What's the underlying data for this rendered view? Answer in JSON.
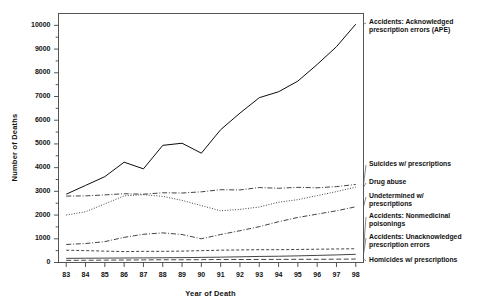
{
  "chart_data": {
    "type": "line",
    "title": "",
    "xlabel": "Year of Death",
    "ylabel": "Number of Deaths",
    "x": [
      83,
      84,
      85,
      86,
      87,
      88,
      89,
      90,
      91,
      92,
      93,
      94,
      95,
      96,
      97,
      98
    ],
    "xtick_labels": [
      "83",
      "84",
      "85",
      "86",
      "87",
      "88",
      "89",
      "90",
      "91",
      "92",
      "93",
      "94",
      "95",
      "96",
      "97",
      "98"
    ],
    "ytick_labels": [
      "0",
      "1000",
      "2000",
      "3000",
      "4000",
      "5000",
      "6000",
      "7000",
      "8000",
      "9000",
      "10000"
    ],
    "ylim": [
      0,
      10500
    ],
    "xlim": [
      82.6,
      98.4
    ],
    "grid": false,
    "legend_position": "right-outside",
    "series": [
      {
        "name": "Accidents: Acknowledged prescription errors (APE)",
        "label": "Accidents: Acknowledged\nprescription errors (APE)",
        "style": "solid",
        "color": "#000000",
        "values": [
          2880,
          3250,
          3620,
          4230,
          3950,
          4940,
          5030,
          4610,
          5600,
          6300,
          6950,
          7200,
          7650,
          8350,
          9100,
          10050
        ]
      },
      {
        "name": "Suicides w/ prescriptions",
        "label": "Suicides w/ prescriptions",
        "style": "dashdot",
        "color": "#222222",
        "values": [
          2800,
          2810,
          2850,
          2900,
          2880,
          2940,
          2930,
          2980,
          3070,
          3060,
          3160,
          3130,
          3170,
          3150,
          3200,
          3290
        ]
      },
      {
        "name": "Drug abuse",
        "label": "Drug abuse",
        "style": "dotted",
        "color": "#222222",
        "values": [
          2000,
          2140,
          2470,
          2810,
          2860,
          2790,
          2620,
          2400,
          2180,
          2240,
          2340,
          2540,
          2650,
          2820,
          2990,
          3180
        ]
      },
      {
        "name": "Undetermined w/ prescriptions",
        "label": "Undetermined w/\nprescriptions",
        "style": "dashdot",
        "color": "#222222",
        "values": [
          760,
          800,
          880,
          1060,
          1190,
          1250,
          1180,
          1000,
          1180,
          1340,
          1510,
          1720,
          1900,
          2040,
          2180,
          2350
        ]
      },
      {
        "name": "Accidents: Nonmedicinal poisonings",
        "label": "Accidents: Nonmedicinal\npoisonings",
        "style": "dashed",
        "color": "#222222",
        "values": [
          520,
          500,
          480,
          460,
          470,
          470,
          480,
          500,
          520,
          530,
          540,
          540,
          550,
          560,
          570,
          580
        ]
      },
      {
        "name": "Accidents: Unacknowledged prescription errors",
        "label": "Accidents: Unacknowledged\nprescription errors",
        "style": "solid-thin",
        "color": "#222222",
        "values": [
          175,
          180,
          185,
          190,
          195,
          200,
          205,
          215,
          225,
          240,
          255,
          265,
          280,
          300,
          320,
          345
        ]
      },
      {
        "name": "Homicides w/ prescriptions",
        "label": "Homicides w/ prescriptions",
        "style": "dashed-long",
        "color": "#222222",
        "values": [
          90,
          95,
          100,
          105,
          110,
          115,
          115,
          120,
          125,
          125,
          130,
          130,
          135,
          135,
          140,
          145
        ]
      }
    ],
    "legend_entries": [
      {
        "label": "Accidents: Acknowledged\nprescription errors (APE)",
        "y": 18
      },
      {
        "label": "Suicides w/ prescriptions",
        "y": 160
      },
      {
        "label": "Drug abuse",
        "y": 178
      },
      {
        "label": "Undetermined w/\nprescriptions",
        "y": 192
      },
      {
        "label": "Accidents: Nonmedicinal\npoisonings",
        "y": 212
      },
      {
        "label": "Accidents: Unacknowledged\nprescription errors",
        "y": 233
      },
      {
        "label": "Homicides w/ prescriptions",
        "y": 256
      }
    ]
  }
}
